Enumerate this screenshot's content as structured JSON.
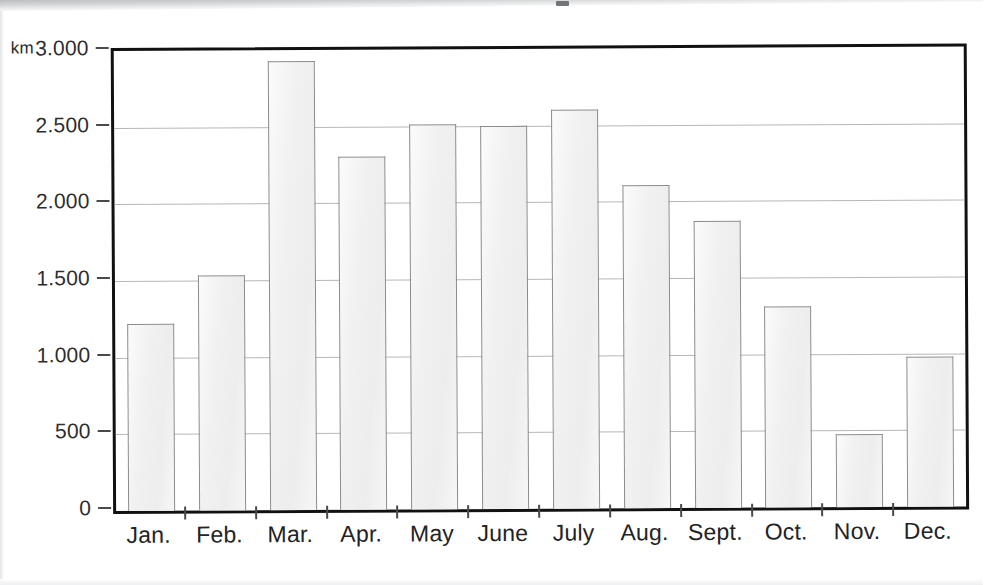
{
  "figure": {
    "unit_label": "km",
    "background_color": "#ffffff",
    "frame_color": "#111111",
    "gridline_color": "#b5b7b9",
    "bar_fill_color": "#f1f1f1",
    "bar_border_color": "#8a8c8e"
  },
  "chart_data": {
    "type": "bar",
    "title": "",
    "subtitle": "",
    "xlabel": "",
    "ylabel": "km",
    "categories": [
      "Jan.",
      "Feb.",
      "Mar.",
      "Apr.",
      "May",
      "June",
      "July",
      "Aug.",
      "Sept.",
      "Oct.",
      "Nov.",
      "Dec."
    ],
    "values": [
      1220,
      1530,
      2930,
      2300,
      2510,
      2500,
      2600,
      2105,
      1875,
      1310,
      475,
      980
    ],
    "ylim": [
      0,
      3000
    ],
    "ytick_values": [
      0,
      500,
      1000,
      1500,
      2000,
      2500,
      3000
    ],
    "ytick_labels": [
      "0",
      "500",
      "1.000",
      "1.500",
      "2.000",
      "2.500",
      "3.000"
    ],
    "grid": true,
    "grid_axis": "y",
    "legend": false,
    "legend_position": "none",
    "annotations": []
  }
}
